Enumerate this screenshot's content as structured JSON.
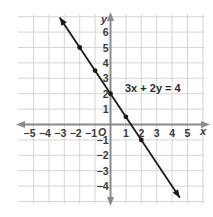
{
  "chart_data": {
    "type": "line",
    "title": "",
    "equation_label": "3x + 2y = 4",
    "xlabel": "x",
    "ylabel": "y",
    "origin_label": "O",
    "xlim": [
      -6,
      6
    ],
    "ylim": [
      -5,
      7
    ],
    "grid": true,
    "x_ticks": [
      -5,
      -4,
      -3,
      -2,
      -1,
      1,
      2,
      3,
      4,
      5
    ],
    "x_tick_labels": [
      "−5",
      "−4",
      "−3",
      "−2",
      "−1",
      "1",
      "2",
      "3",
      "4",
      "5"
    ],
    "y_ticks": [
      6,
      5,
      4,
      3,
      2,
      1,
      -1,
      -2,
      -3,
      -4
    ],
    "y_tick_labels": [
      "6",
      "5",
      "4",
      "3",
      "2",
      "1",
      "−1",
      "−2",
      "−3",
      "−4"
    ],
    "series": [
      {
        "name": "3x + 2y = 4",
        "slope": -1.5,
        "intercept": 2,
        "points": [
          {
            "x": -2,
            "y": 5
          },
          {
            "x": -1,
            "y": 3.5
          },
          {
            "x": 0,
            "y": 2
          },
          {
            "x": 1,
            "y": 0.5
          },
          {
            "x": 2,
            "y": -1
          }
        ],
        "arrows_both_ends": true
      }
    ]
  },
  "colors": {
    "grid": "#d6d6d6",
    "axis": "#8a8a8a",
    "line": "#1a1a1a",
    "text": "#3a3a3a"
  }
}
